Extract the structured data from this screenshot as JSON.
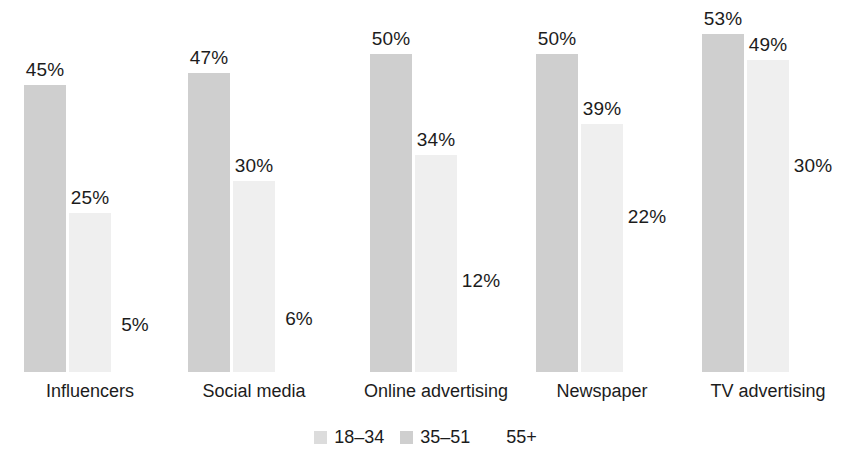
{
  "chart_data": {
    "type": "bar",
    "title": "",
    "subtitle": "",
    "xlabel": "",
    "ylabel": "",
    "ylim": [
      0,
      53
    ],
    "grid": false,
    "legend_position": "bottom-center",
    "value_suffix": "%",
    "categories": [
      "Influencers",
      "Social media",
      "Online advertising",
      "Newspaper",
      "TV advertising"
    ],
    "series": [
      {
        "name": "18–34",
        "color": "#cfcfcf",
        "values": [
          45,
          47,
          50,
          50,
          53
        ],
        "labels": [
          "45%",
          "47%",
          "50%",
          "50%",
          "53%"
        ]
      },
      {
        "name": "35–51",
        "color": "#efefef",
        "values": [
          25,
          30,
          34,
          39,
          49
        ],
        "labels": [
          "25%",
          "30%",
          "34%",
          "39%",
          "49%"
        ]
      },
      {
        "name": "55+",
        "color": "#ffffff",
        "values": [
          5,
          6,
          12,
          22,
          30
        ],
        "labels": [
          "5%",
          "6%",
          "12%",
          "22%",
          "30%"
        ]
      }
    ]
  },
  "legend": {
    "entries": [
      {
        "label": "18–34",
        "color": "#dcdcdc"
      },
      {
        "label": "35–51",
        "color": "#cfcfcf"
      },
      {
        "label": "55+",
        "color": "#ffffff"
      }
    ]
  },
  "layout": {
    "group_left_px": [
      24,
      188,
      370,
      536,
      702
    ],
    "group_width_px": 130,
    "bar_width_px": 42,
    "bar_gap_px": 3,
    "baseline_y_px": 372,
    "px_per_percent": 6.37,
    "label_offset_px": 26
  }
}
